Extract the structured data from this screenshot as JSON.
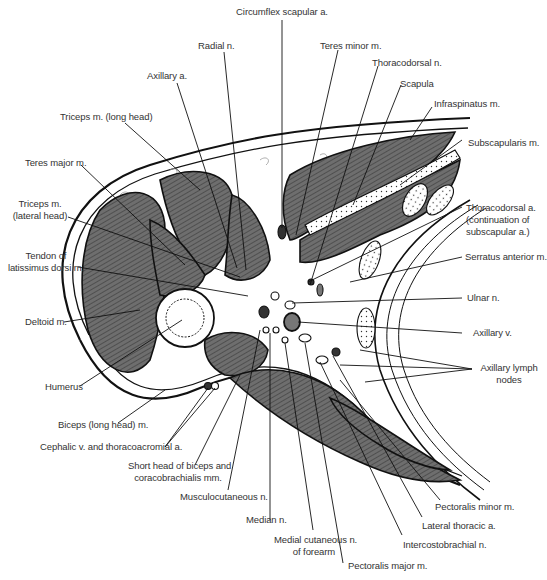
{
  "figure": {
    "colors": {
      "muscle": "#6f6f6f",
      "line": "#111111",
      "background": "#ffffff",
      "fat": "#ffffff",
      "bone": "#ffffff"
    }
  },
  "labels": {
    "circumflex_scapular_a": "Circumflex scapular a.",
    "radial_n": "Radial n.",
    "teres_minor_m": "Teres minor m.",
    "axillary_a": "Axillary a.",
    "thoracodorsal_n": "Thoracodorsal n.",
    "scapula": "Scapula",
    "infraspinatus_m": "Infraspinatus m.",
    "triceps_long_head": "Triceps m. (long head)",
    "subscapularis_m": "Subscapularis m.",
    "teres_major_m": "Teres major m.",
    "triceps_lateral_1": "Triceps m.",
    "triceps_lateral_2": "(lateral head)",
    "thoracodorsal_a_1": "Thoracodorsal a.",
    "thoracodorsal_a_2": "(continuation of",
    "thoracodorsal_a_3": "subscapular a.)",
    "tendon_ld_1": "Tendon of",
    "tendon_ld_2": "latissimus dorsi m.",
    "serratus_anterior_m": "Serratus anterior m.",
    "ulnar_n": "Ulnar n.",
    "deltoid_m": "Deltoid m.",
    "axillary_v": "Axillary v.",
    "axillary_lymph_1": "Axillary lymph",
    "axillary_lymph_2": "nodes",
    "humerus": "Humerus",
    "biceps_long_head": "Biceps (long head) m.",
    "cephalic_v": "Cephalic v. and thoracoacromial a.",
    "short_head_1": "Short head of biceps and",
    "short_head_2": "coracobrachialis mm.",
    "musculocutaneous_n": "Musculocutaneous n.",
    "pectoralis_minor_m": "Pectoralis minor m.",
    "median_n": "Median n.",
    "lateral_thoracic_a": "Lateral thoracic a.",
    "medial_cutaneous_1": "Medial cutaneous n.",
    "medial_cutaneous_2": "of forearm",
    "intercostobrachial_n": "Intercostobrachial n.",
    "pectoralis_major_m": "Pectoralis major m."
  }
}
